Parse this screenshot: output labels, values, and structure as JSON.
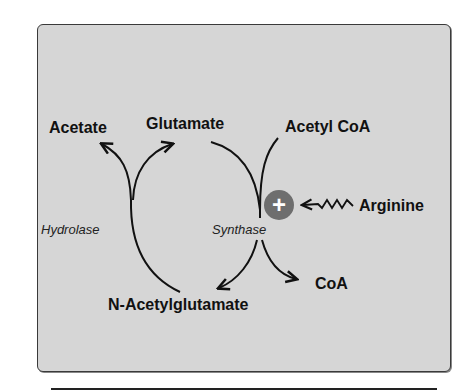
{
  "diagram": {
    "nodes": {
      "acetate": "Acetate",
      "glutamate": "Glutamate",
      "acetyl_coa": "Acetyl CoA",
      "arginine": "Arginine",
      "coa": "CoA",
      "n_acetylglutamate": "N-Acetylglutamate"
    },
    "enzymes": {
      "hydrolase": "Hydrolase",
      "synthase": "Synthase"
    },
    "activator": {
      "symbol": "+",
      "source": "Arginine",
      "target": "Synthase",
      "effect": "activation"
    },
    "edges": [
      {
        "from": "N-Acetylglutamate",
        "to": "Acetate",
        "enzyme": "Hydrolase"
      },
      {
        "from": "N-Acetylglutamate",
        "to": "Glutamate",
        "enzyme": "Hydrolase"
      },
      {
        "from": "Glutamate",
        "to": "N-Acetylglutamate",
        "enzyme": "Synthase"
      },
      {
        "from": "Acetyl CoA",
        "to": "CoA",
        "enzyme": "Synthase"
      },
      {
        "from": "Arginine",
        "to": "Synthase",
        "type": "allosteric-activation"
      }
    ],
    "colors": {
      "panel_background": "#d6d6d6",
      "panel_border": "#3a3a3a",
      "arrow": "#111111",
      "activator_circle": "#6e6e6e",
      "activator_symbol": "#ffffff"
    }
  }
}
